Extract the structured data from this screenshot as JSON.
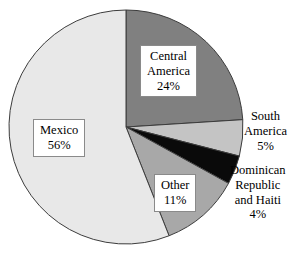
{
  "chart_data": {
    "type": "pie",
    "title": "",
    "subtitle": "",
    "xlabel": "",
    "ylabel": "",
    "legend_position": "none",
    "grid": false,
    "start_angle_deg": 0,
    "direction": "clockwise",
    "center": {
      "x": 126,
      "y": 127
    },
    "radius": 117,
    "categories": [
      "Central America",
      "South America",
      "Dominican Republic and Haiti",
      "Other",
      "Mexico"
    ],
    "values": [
      24,
      5,
      4,
      11,
      56
    ],
    "value_unit": "%",
    "slices": [
      {
        "name": "Central America",
        "label_lines": [
          "Central",
          "America",
          "24%"
        ],
        "value": 24,
        "value_text": "24%",
        "color": "#808080",
        "label_style": "boxed-inside"
      },
      {
        "name": "South America",
        "label_lines": [
          "South",
          "America",
          "5%"
        ],
        "value": 5,
        "value_text": "5%",
        "color": "#c4c4c4",
        "label_style": "plain-outside"
      },
      {
        "name": "Dominican Republic and Haiti",
        "label_lines": [
          "Dominican",
          "Republic",
          "and Haiti",
          "4%"
        ],
        "value": 4,
        "value_text": "4%",
        "color": "#0a0a0a",
        "label_style": "plain-outside"
      },
      {
        "name": "Other",
        "label_lines": [
          "Other",
          "11%"
        ],
        "value": 11,
        "value_text": "11%",
        "color": "#a8a8a8",
        "label_style": "boxed-inside"
      },
      {
        "name": "Mexico",
        "label_lines": [
          "Mexico",
          "56%"
        ],
        "value": 56,
        "value_text": "56%",
        "color": "#e8e8e8",
        "label_style": "boxed-inside"
      }
    ],
    "colors": {
      "central_america": "#808080",
      "south_america": "#c4c4c4",
      "dominican_republic_haiti": "#0a0a0a",
      "other": "#a8a8a8",
      "mexico": "#e8e8e8",
      "outline": "#3c3c3c",
      "background": "#ffffff",
      "text": "#000000",
      "label_box_border": "#8a8a8a"
    }
  },
  "labels": {
    "mexico": {
      "line1": "Mexico",
      "line2": "56%"
    },
    "central_america": {
      "line1": "Central",
      "line2": "America",
      "line3": "24%"
    },
    "south_america": {
      "line1": "South",
      "line2": "America",
      "line3": "5%"
    },
    "dominican": {
      "line1": "Dominican",
      "line2": "Republic",
      "line3": "and Haiti",
      "line4": "4%"
    },
    "other": {
      "line1": "Other",
      "line2": "11%"
    }
  }
}
